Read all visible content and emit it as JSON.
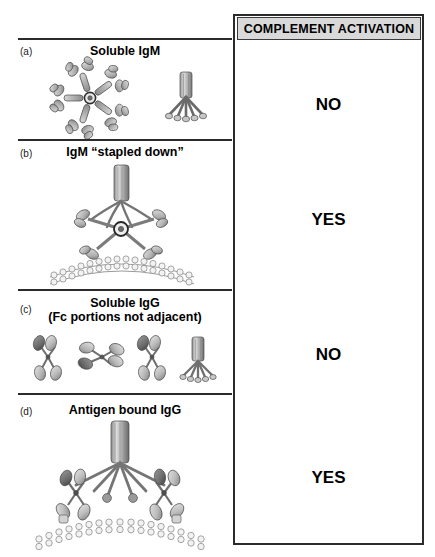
{
  "figure": {
    "type": "scientific-diagram"
  },
  "header": {
    "title": "COMPLEMENT ACTIVATION"
  },
  "panels": [
    {
      "letter": "(a)",
      "title": "Soluble IgM",
      "title_line2": "",
      "answer": "NO",
      "molecules": "IgM pentamer (planar star form) and IgM side view",
      "membrane": false
    },
    {
      "letter": "(b)",
      "title": "IgM “stapled down”",
      "title_line2": "",
      "answer": "YES",
      "molecules": "IgM pentamer in staple conformation bound to antigen on cell membrane with C1q",
      "membrane": true
    },
    {
      "letter": "(c)",
      "title": "Soluble IgG",
      "title_line2": "(Fc portions not adjacent)",
      "answer": "NO",
      "molecules": "Three separate soluble IgG monomers and one C1q molecule",
      "membrane": false
    },
    {
      "letter": "(d)",
      "title": "Antigen bound IgG",
      "title_line2": "",
      "answer": "YES",
      "molecules": "Two adjacent membrane-bound IgG molecules engaged by C1q",
      "membrane": true
    }
  ],
  "icons": {
    "igm_pentamer": "igm-pentamer-icon",
    "igm_side": "igm-side-view-icon",
    "igg": "igg-monomer-icon",
    "c1q": "c1q-icon",
    "membrane": "lipid-bilayer-icon"
  },
  "colors": {
    "header_fill": "#d9d9d9",
    "rule": "#2b2b2b",
    "protein_light": "#cfcfcf",
    "protein_mid": "#9a9a9a",
    "protein_dark": "#5b5b5b",
    "outline": "#4a4a4a"
  }
}
